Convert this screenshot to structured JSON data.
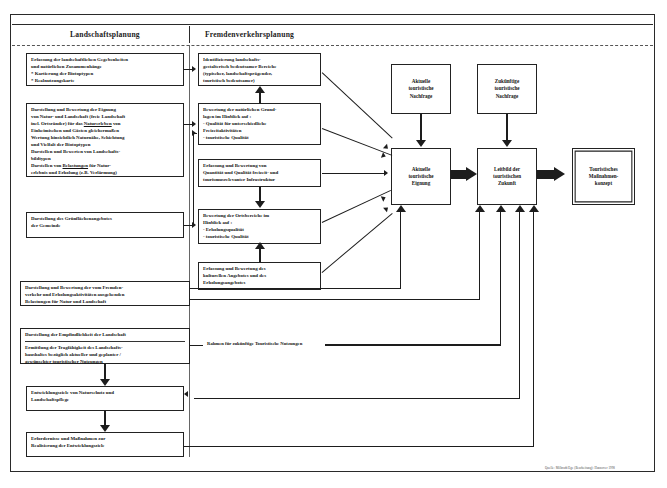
{
  "figure": {
    "columns": {
      "left_heading": "Landschaftsplanung",
      "right_heading": "Fremdenverkehrsplanung"
    },
    "annotation": "Rahmen für zukünftige Touristische Nutzungen",
    "credit": "Quelle: Milbradt/Ege (Bearbeitung): Hannover 1998"
  },
  "left_boxes": {
    "l1": {
      "lines": [
        "Erfassung der landschaftlichen Gegebenheiten",
        "und natürlichen Zusammenhänge",
        "* Kartierung der Biotoptypen",
        "* Realnutzungskarte"
      ]
    },
    "l2": {
      "lines": [
        "Darstellung und Bewertung der Eignung",
        "von  Natur- und Landschaft (freie Landschaft",
        "incl. Ortsränder) für das Naturerleben von",
        "Einheimischen und Gästen gleichermaßen",
        "Wertung hinsichtlich Naturnähe, Schichtung",
        "und Vielfalt der Biotoptypen",
        "Darstellen und Bewerten von Landschafts-",
        "bildtypen",
        "Darstellen von Belastungen für Natur-",
        "erlebnis und Erholung (z.B. Verlärmung)"
      ]
    },
    "l3": {
      "lines": [
        "Darstellung des Grünflächenangebotes",
        "der Gemeinde"
      ]
    },
    "l4": {
      "lines": [
        "Darstellung und Bewertung  der vom Fremden-",
        "verkehr und Erholungsaktivitäten ausgehenden",
        "Belastungen für Natur und Landschaft"
      ]
    },
    "l5": {
      "top": "Darstellung der Empfindlichkeit der Landschaft",
      "lines": [
        "Ermittlung der Tragfähigkeit des Landschafts-",
        "haushaltes bezüglich aktueller und geplanter /",
        "gewünschter touristischer Nutzungen"
      ]
    },
    "l6": {
      "lines": [
        "Entwicklungsziele von Naturschutz und",
        "Landschaftspflege"
      ]
    },
    "l7": {
      "lines": [
        "Erfordernisse und Maßnahmen zur",
        "Realisierung der Entwicklungsziele"
      ]
    }
  },
  "mid_boxes": {
    "m1": {
      "lines": [
        "Identifizierung landschafts-",
        "gestalterisch bedeutsamer Bereiche",
        "(typischer, landschaftsprägender,",
        "touristisch bedeutsamer)"
      ]
    },
    "m2": {
      "lines": [
        "Bewertung der natürlichen Grund-",
        "lagen im Hinblick auf :",
        "- Qualität für unterschiedliche",
        "  Freizeitaktivitäten",
        "- touristische Qualität"
      ]
    },
    "m3": {
      "lines": [
        "Erfassung und Bewertung von",
        "Quantität und Qualität freizeit- und",
        "tourismusrelevanter Infrastruktur"
      ]
    },
    "m4": {
      "lines": [
        "Bewertung der Ortsbereiche im",
        "Hinblick auf :",
        "- Erholungsqualität",
        "- touristische Qualität"
      ]
    },
    "m5": {
      "lines": [
        "Erfassung und Bewertung des",
        "kulturellen  Angebotes und des",
        "Erholungsangebotes"
      ]
    }
  },
  "right_boxes": {
    "r1": {
      "lines": [
        "Aktuelle",
        "touristische",
        "Nachfrage"
      ]
    },
    "r2": {
      "lines": [
        "Zukünftige",
        "touristische",
        "Nachfrage"
      ]
    },
    "r3": {
      "lines": [
        "Aktuelle",
        "touristische",
        "Eignung"
      ]
    },
    "r4": {
      "lines": [
        "Leitbild der",
        "touristischen",
        "Zukunft"
      ]
    },
    "r5": {
      "lines": [
        "Touristisches",
        "Maßnahmen-",
        "konzept"
      ]
    }
  }
}
